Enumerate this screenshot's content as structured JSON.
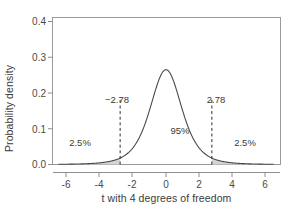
{
  "chart_data": {
    "type": "line",
    "title": "",
    "subtitle": "",
    "xlabel": "t with 4 degrees of freedom",
    "ylabel": "Probability density",
    "xlim": [
      -6.5,
      6.5
    ],
    "ylim": [
      0.0,
      0.42
    ],
    "grid": false,
    "legend": null,
    "distribution": "Student t",
    "degrees_of_freedom": 4,
    "peak_value": 0.375,
    "xticks": [
      -6,
      -4,
      -2,
      0,
      2,
      4,
      6
    ],
    "xtick_labels": [
      "-6",
      "-4",
      "-2",
      "0",
      "2",
      "4",
      "6"
    ],
    "yticks": [
      0.0,
      0.1,
      0.2,
      0.3,
      0.4
    ],
    "ytick_labels": [
      "0.0",
      "0.1",
      "0.2",
      "0.3",
      "0.4"
    ],
    "x": [
      -6.5,
      -6.0,
      -5.5,
      -5.0,
      -4.5,
      -4.0,
      -3.5,
      -3.0,
      -2.78,
      -2.5,
      -2.0,
      -1.5,
      -1.0,
      -0.5,
      0.0,
      0.5,
      1.0,
      1.5,
      2.0,
      2.5,
      2.78,
      3.0,
      3.5,
      4.0,
      4.5,
      5.0,
      5.5,
      6.0,
      6.5
    ],
    "y": [
      0.0021,
      0.003,
      0.0043,
      0.0064,
      0.0099,
      0.016,
      0.0271,
      0.048,
      0.0592,
      0.0807,
      0.1297,
      0.1893,
      0.2434,
      0.285,
      0.375,
      0.285,
      0.2434,
      0.1893,
      0.1297,
      0.0807,
      0.0592,
      0.048,
      0.0271,
      0.016,
      0.0099,
      0.0064,
      0.0043,
      0.003,
      0.0021
    ],
    "critical_values": [
      -2.78,
      2.78
    ],
    "shaded_tails": [
      {
        "name": "left-tail",
        "from": -6.5,
        "to": -2.78,
        "area_label": "2.5%"
      },
      {
        "name": "right-tail",
        "from": 2.78,
        "to": 6.5,
        "area_label": "2.5%"
      }
    ],
    "annotations": [
      {
        "name": "left-critical-value",
        "text": "−2.78",
        "x": -2.78,
        "y": 0.205
      },
      {
        "name": "right-critical-value",
        "text": "2.78",
        "x": 2.78,
        "y": 0.205
      },
      {
        "name": "left-tail-area",
        "text": "2.5%",
        "x": -4.05,
        "y": 0.055
      },
      {
        "name": "right-tail-area",
        "text": "2.5%",
        "x": 4.05,
        "y": 0.055
      },
      {
        "name": "central-area",
        "text": "95%",
        "x": 0.85,
        "y": 0.115
      }
    ],
    "colors": {
      "curve": "#4a4a4a",
      "frame": "#9a9a9a",
      "shade_fill": "#d5d5d5",
      "dashed_line": "#2e2e2e",
      "text": "#3b3b3b",
      "background": "#ffffff"
    }
  },
  "axes": {
    "ylabel": "Probability density",
    "xlabel": "t with 4 degrees of freedom",
    "ytick_labels": [
      "0.4",
      "0.3",
      "0.2",
      "0.1",
      "0.0"
    ],
    "xtick_labels": [
      "-6",
      "-4",
      "-2",
      "0",
      "2",
      "4",
      "6"
    ]
  },
  "annotations": {
    "left_critical": "−2.78",
    "right_critical": "2.78",
    "left_tail_pct": "2.5%",
    "right_tail_pct": "2.5%",
    "central_pct": "95%"
  }
}
